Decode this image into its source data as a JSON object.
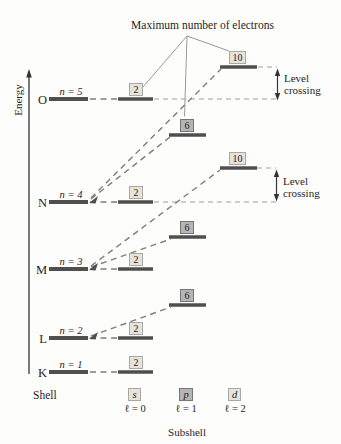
{
  "title": "Maximum number of electrons",
  "axis": {
    "energy_label": "Energy",
    "shell_label": "Shell",
    "subshell_label": "Subshell"
  },
  "levels": [
    {
      "shell": "O",
      "n_label": "n = 5"
    },
    {
      "shell": "N",
      "n_label": "n = 4"
    },
    {
      "shell": "M",
      "n_label": "n = 3"
    },
    {
      "shell": "L",
      "n_label": "n = 2"
    },
    {
      "shell": "K",
      "n_label": "n = 1"
    }
  ],
  "max_electrons": {
    "s": "2",
    "p": "6",
    "d": "10"
  },
  "visible_subshell_bars": {
    "O": [
      "s"
    ],
    "N": [
      "s",
      "p",
      "d"
    ],
    "M": [
      "s",
      "p",
      "d"
    ],
    "L": [
      "s",
      "p"
    ],
    "K": [
      "s"
    ]
  },
  "subshell_legend": [
    {
      "symbol": "s",
      "l_label": "ℓ = 0"
    },
    {
      "symbol": "p",
      "l_label": "ℓ = 1"
    },
    {
      "symbol": "d",
      "l_label": "ℓ = 2"
    }
  ],
  "annotations": {
    "level_crossing_line1": "Level",
    "level_crossing_line2": "crossing"
  },
  "colors": {
    "bar_color": "#4f4f4f",
    "dash_color": "#7e7e7e",
    "dash_light": "#a0a0a0",
    "box_light": "#e5e3da",
    "box_light_border": "#a9a9a4",
    "box_dark": "#b5b5b5",
    "box_dark_border": "#767676",
    "text_color": "#1f1f1f",
    "pointer_color": "#999999"
  }
}
